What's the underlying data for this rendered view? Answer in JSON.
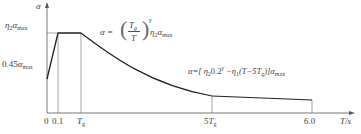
{
  "diagram": {
    "y_axis": {
      "label": "α",
      "ticks": [
        "η₂αmax",
        "0.45αmax"
      ]
    },
    "x_axis": {
      "label": "T/s",
      "ticks": [
        "0",
        "0.1",
        "Tg",
        "5Tg",
        "6.0"
      ]
    },
    "segments": [
      {
        "name": "linear-rise",
        "range": "0–0.1",
        "from": "0.45αmax",
        "to": "η₂αmax"
      },
      {
        "name": "plateau",
        "range": "0.1–Tg",
        "value": "η₂αmax"
      },
      {
        "name": "curve-decay",
        "range": "Tg–5Tg",
        "formula": "α=(Tg/T)^γ η₂αmax"
      },
      {
        "name": "linear-decay",
        "range": "5Tg–6.0",
        "formula": "α=[η₂0.2^γ−η₁(T−5Tg)]αmax"
      }
    ],
    "labels": {
      "alpha": "α",
      "eta2": "η",
      "eta2_sub": "2",
      "amax": "α",
      "amax_sub": "max",
      "045": "0.45",
      "t0": "0",
      "t01": "0.1",
      "tg": "T",
      "tg_sub": "g",
      "t5": "5",
      "t6": "6.0",
      "ts": "T/s",
      "f1_lhs": "α =",
      "f1_num": "T",
      "f1_num_sub": "g",
      "f1_den": "T",
      "f1_exp": "γ",
      "f1_tail": "η",
      "f1_tail_sub": "2",
      "f1_amax": "α",
      "f1_amax_sub": "max",
      "f2": "α=[ η",
      "f2_sub1": "2",
      "f2_mid": "0.2",
      "f2_gamma": "γ",
      "f2_rest": " −η",
      "f2_sub2": "1",
      "f2_paren": "(T−5T",
      "f2_sub3": "g",
      "f2_close": ")]α",
      "f2_sub4": "max"
    }
  }
}
